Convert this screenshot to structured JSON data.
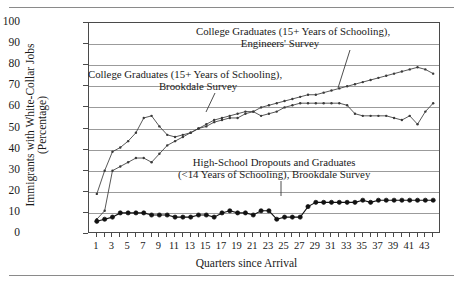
{
  "figure": {
    "ylabel_line1": "Immigrants with White-Collar Jobs",
    "ylabel_line2": "(Percentage)",
    "xlabel": "Quarters since Arrival"
  },
  "annotations": {
    "engineers": {
      "line1": "College Graduates (15+ Years of Schooling),",
      "line2": "Engineers' Survey"
    },
    "brookdale_college": {
      "line1": "College Graduates (15+ Years of Schooling),",
      "line2": "Brookdale Survey"
    },
    "highschool": {
      "line1": "High-School Dropouts and Graduates",
      "line2": "(<14 Years of Schooling), Brookdale Survey"
    }
  },
  "chart_data": {
    "type": "line",
    "title": "",
    "xlabel": "Quarters since Arrival",
    "ylabel": "Immigrants with White-Collar Jobs (Percentage)",
    "xlim": [
      0,
      45
    ],
    "ylim": [
      0,
      100
    ],
    "yticks": [
      0,
      10,
      20,
      30,
      40,
      50,
      60,
      70,
      80,
      90,
      100
    ],
    "xticks": [
      1,
      3,
      5,
      7,
      9,
      11,
      13,
      15,
      17,
      19,
      21,
      23,
      25,
      27,
      29,
      31,
      33,
      35,
      37,
      39,
      41,
      43
    ],
    "grid": true,
    "legend": "inline-annotations",
    "x": [
      1,
      2,
      3,
      4,
      5,
      6,
      7,
      8,
      9,
      10,
      11,
      12,
      13,
      14,
      15,
      16,
      17,
      18,
      19,
      20,
      21,
      22,
      23,
      24,
      25,
      26,
      27,
      28,
      29,
      30,
      31,
      32,
      33,
      34,
      35,
      36,
      37,
      38,
      39,
      40,
      41,
      42,
      43,
      44
    ],
    "series": [
      {
        "name": "College Graduates (15+ Years of Schooling), Engineers' Survey",
        "marker": "open-small",
        "color": "#3a3a3a",
        "values": [
          19,
          30,
          39,
          41,
          44,
          48,
          55,
          56,
          51,
          47,
          46,
          47,
          48,
          50,
          51,
          53,
          54,
          55,
          55,
          57,
          58,
          60,
          61,
          62,
          63,
          64,
          65,
          66,
          66,
          67,
          68,
          69,
          70,
          71,
          72,
          73,
          74,
          75,
          76,
          77,
          78,
          79,
          78,
          76
        ]
      },
      {
        "name": "College Graduates (15+ Years of Schooling), Brookdale Survey",
        "marker": "open-small",
        "color": "#3a3a3a",
        "values": [
          7,
          11,
          30,
          32,
          34,
          36,
          36,
          34,
          38,
          42,
          44,
          46,
          48,
          50,
          52,
          54,
          55,
          56,
          57,
          58,
          58,
          56,
          57,
          58,
          60,
          61,
          62,
          62,
          62,
          62,
          62,
          62,
          61,
          57,
          56,
          56,
          56,
          56,
          55,
          54,
          56,
          52,
          58,
          62
        ]
      },
      {
        "name": "High-School Dropouts and Graduates (<14 Years of Schooling), Brookdale Survey",
        "marker": "filled",
        "color": "#111111",
        "values": [
          6,
          7,
          8,
          10,
          10,
          10,
          10,
          9,
          9,
          9,
          8,
          8,
          8,
          9,
          9,
          8,
          10,
          11,
          10,
          10,
          9,
          11,
          11,
          7,
          8,
          8,
          8,
          13,
          15,
          15,
          15,
          15,
          15,
          15,
          16,
          15,
          16,
          16,
          16,
          16,
          16,
          16,
          16,
          16
        ]
      }
    ]
  }
}
